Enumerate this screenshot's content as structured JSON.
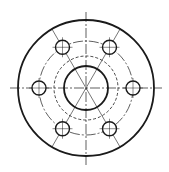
{
  "drawing": {
    "title": "Flange plan view",
    "background": "#ffffff",
    "stroke_color": "#1a1a1a",
    "center": {
      "x": 86,
      "y": 88
    },
    "outer_circle": {
      "r": 68,
      "width": 1.8
    },
    "bolt_circle": {
      "r": 47,
      "style": "dash-dot"
    },
    "hidden_circle": {
      "r": 32,
      "style": "dashed"
    },
    "bore_circle": {
      "r": 22,
      "width": 1.8
    },
    "bolt_holes": {
      "count": 6,
      "r": 7,
      "angles_deg": [
        0,
        60,
        120,
        180,
        240,
        300
      ]
    },
    "centerlines": {
      "horizontal": {
        "x1": 10,
        "x2": 162
      },
      "vertical": {
        "y1": 12,
        "y2": 165
      }
    }
  }
}
